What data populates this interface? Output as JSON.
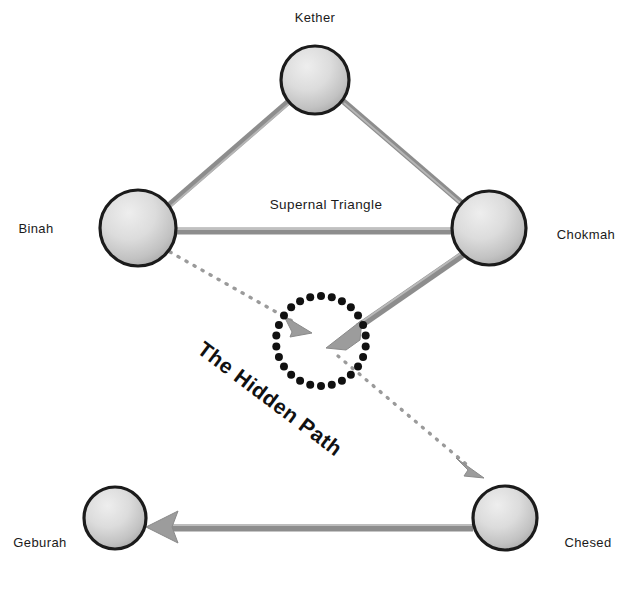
{
  "diagram": {
    "background_color": "#ffffff",
    "width": 626,
    "height": 615,
    "nodes": [
      {
        "id": "kether",
        "label": "Kether",
        "cx": 315,
        "cy": 80,
        "r": 34,
        "label_x": 315,
        "label_y": 22,
        "label_anchor": "middle"
      },
      {
        "id": "binah",
        "label": "Binah",
        "cx": 138,
        "cy": 228,
        "r": 38,
        "label_x": 36,
        "label_y": 233,
        "label_anchor": "middle"
      },
      {
        "id": "chokmah",
        "label": "Chokmah",
        "cx": 489,
        "cy": 228,
        "r": 37,
        "label_x": 586,
        "label_y": 239,
        "label_anchor": "middle"
      },
      {
        "id": "geburah",
        "label": "Geburah",
        "cx": 115,
        "cy": 518,
        "r": 31,
        "label_x": 40,
        "label_y": 547,
        "label_anchor": "middle"
      },
      {
        "id": "chesed",
        "label": "Chesed",
        "cx": 505,
        "cy": 518,
        "r": 32,
        "label_x": 588,
        "label_y": 547,
        "label_anchor": "middle"
      }
    ],
    "region_labels": [
      {
        "id": "supernal-triangle",
        "text": "Supernal Triangle",
        "x": 326,
        "y": 209
      }
    ],
    "hidden_path": {
      "label": "The Hidden Path",
      "circle_cx": 321,
      "circle_cy": 341,
      "circle_r": 45,
      "dot_count": 26,
      "dot_radius": 4,
      "dot_color": "#111111",
      "label_x": 196,
      "label_y": 352,
      "label_rotation": 37
    },
    "edges": [
      {
        "id": "binah-kether",
        "from": "binah",
        "to": "kether",
        "style": "solid",
        "arrow": false,
        "color": "#8d8d8d"
      },
      {
        "id": "kether-chokmah",
        "from": "kether",
        "to": "chokmah",
        "style": "solid",
        "arrow": false,
        "color": "#8d8d8d"
      },
      {
        "id": "binah-chokmah",
        "from": "binah",
        "to": "chokmah",
        "style": "solid",
        "arrow": false,
        "color": "#8d8d8d"
      },
      {
        "id": "chokmah-hidden",
        "from": "chokmah",
        "to": "hidden",
        "style": "solid",
        "arrow": true,
        "color": "#8d8d8d"
      },
      {
        "id": "binah-hidden",
        "from": "binah",
        "to": "hidden",
        "style": "dotted",
        "arrow": true,
        "color": "#9a9a9a"
      },
      {
        "id": "hidden-chesed",
        "from": "hidden",
        "to": "chesed",
        "style": "dotted",
        "arrow": true,
        "color": "#9a9a9a"
      },
      {
        "id": "chesed-geburah",
        "from": "chesed",
        "to": "geburah",
        "style": "solid",
        "arrow": true,
        "color": "#8d8d8d"
      }
    ],
    "colors": {
      "node_fill_light": "#e8e8e8",
      "node_fill_dark": "#a8a8a8",
      "node_stroke": "#1b1b1b",
      "edge_gray": "#8d8d8d",
      "dotted_gray": "#9a9a9a",
      "text": "#1a1a1a",
      "dot_black": "#111111"
    }
  }
}
